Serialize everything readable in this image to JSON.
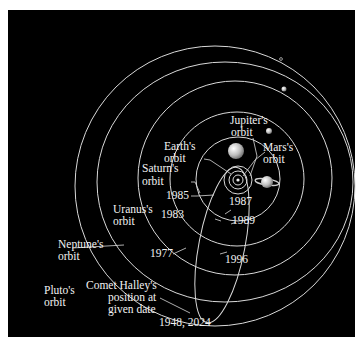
{
  "colors": {
    "background": "#000000",
    "frame": "#ffffff",
    "orbit_line": "#d9d9d9",
    "text": "#f2f2f2"
  },
  "labels": {
    "jupiter": [
      "Jupiter's",
      "orbit"
    ],
    "earth": [
      "Earth's",
      "orbit"
    ],
    "mars": [
      "Mars's",
      "orbit"
    ],
    "saturn": [
      "Saturn's",
      "orbit"
    ],
    "uranus": [
      "Uranus's",
      "orbit"
    ],
    "neptune": [
      "Neptune's",
      "orbit"
    ],
    "pluto": [
      "Pluto's",
      "orbit"
    ],
    "halley": [
      "Comet Halley's",
      "position at",
      "given date"
    ]
  },
  "dates": {
    "d1985": "1985",
    "d1987": "1987",
    "d1983": "1983",
    "d1989": "1989",
    "d1977": "1977",
    "d1996": "1996",
    "d1948": "1948, 2024"
  }
}
